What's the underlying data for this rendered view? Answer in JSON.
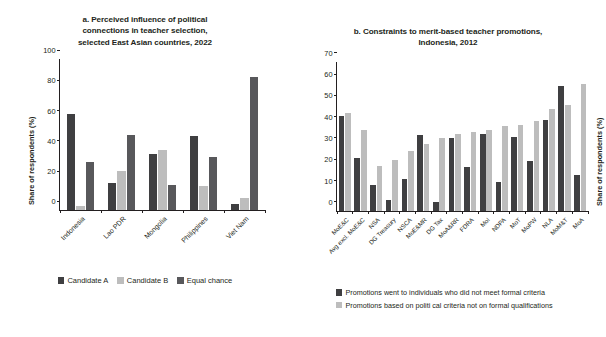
{
  "colors": {
    "candidate_a": "#3f3f41",
    "candidate_b": "#bdbdbd",
    "equal_chance": "#58585b",
    "not_meet_criteria": "#3f3f41",
    "political_criteria": "#bdbdbd",
    "axis": "#231f20",
    "background": "#ffffff"
  },
  "chart_data": [
    {
      "id": "panel-a",
      "type": "bar",
      "title": "a. Perceived influence of political\nconnections in teacher selection,\nselected East Asian countries, 2022",
      "xlabel": "",
      "ylabel": "Share of respondents (%)",
      "ylim": [
        0,
        100
      ],
      "yticks": [
        0,
        20,
        40,
        60,
        80,
        100
      ],
      "grid": false,
      "legend_position": "bottom",
      "categories": [
        "Indonesia",
        "Lao PDR",
        "Mongolia",
        "Philippines",
        "Viet Nam"
      ],
      "series": [
        {
          "name": "Candidate A",
          "color": "#3f3f41",
          "values": [
            64,
            18,
            37,
            49,
            4
          ]
        },
        {
          "name": "Candidate B",
          "color": "#bdbdbd",
          "values": [
            3,
            26,
            40,
            16,
            8
          ]
        },
        {
          "name": "Equal chance",
          "color": "#58585b",
          "values": [
            32,
            50,
            17,
            35,
            88
          ]
        }
      ]
    },
    {
      "id": "panel-b",
      "type": "bar",
      "title": "b. Constraints to merit-based teacher promotions,\nIndonesia, 2012",
      "xlabel": "",
      "ylabel": "Share of respondents (%)",
      "ylim": [
        0,
        70
      ],
      "yticks": [
        0,
        10,
        20,
        30,
        40,
        50,
        60,
        70
      ],
      "grid": false,
      "legend_position": "bottom",
      "categories": [
        "MoE&C",
        "Avg excl. MoE&C",
        "NSA",
        "DG Treasury",
        "NSCA",
        "MoE&MR",
        "DG Tax",
        "MoA&RR",
        "FDRA",
        "MoI",
        "NDPA",
        "MoT",
        "MoPW",
        "NLA",
        "MoM&T",
        "MoA"
      ],
      "series": [
        {
          "name": "Promotions went to individuals who did not meet formal criteria",
          "color": "#3f3f41",
          "values": [
            44.5,
            25,
            12,
            5,
            15,
            35.5,
            4,
            34,
            20.5,
            36,
            13.5,
            34.5,
            23.5,
            42.5,
            58.5,
            17
          ]
        },
        {
          "name": "Promotions based on politi cal criteria not on formal qualifications",
          "color": "#bdbdbd",
          "values": [
            46,
            38,
            21,
            24,
            28,
            31.5,
            34,
            36,
            37,
            38,
            40,
            40.5,
            42,
            48,
            49.5,
            59.5
          ]
        }
      ]
    }
  ]
}
